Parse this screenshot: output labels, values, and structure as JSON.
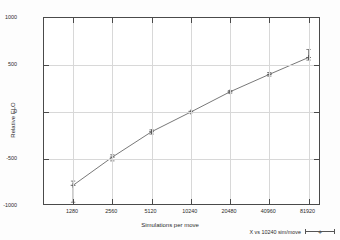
{
  "chart_data": {
    "type": "line",
    "title": "",
    "xlabel": "Simulations per move",
    "ylabel": "Relative ELO",
    "x_scale": "log2",
    "x_tick_labels": [
      "1280",
      "2560",
      "5120",
      "10240",
      "20480",
      "40960",
      "81920"
    ],
    "x": [
      1280,
      2560,
      5120,
      10240,
      20480,
      40960,
      81920
    ],
    "y_tick_labels": [
      "1000",
      "500",
      "0",
      "-500",
      "-1000"
    ],
    "ylim": [
      -1000,
      1000
    ],
    "grid": true,
    "legend_position": "bottom-right",
    "series": [
      {
        "name": "X vs 10240 sim/move",
        "values": [
          -780,
          -480,
          -210,
          0,
          215,
          400,
          580
        ],
        "error_low": [
          -960,
          -520,
          -235,
          -8,
          200,
          382,
          552
        ],
        "error_high": [
          -735,
          -455,
          -190,
          8,
          228,
          420,
          665
        ],
        "marker": "plus",
        "color": "#555555"
      }
    ]
  },
  "legend": {
    "entries": [
      {
        "label": "X vs 10240 sim/move"
      }
    ]
  },
  "colors": {
    "axis": "#4a4a4a",
    "grid": "#d8d8d8",
    "line": "#555555",
    "text": "#2b2b2b",
    "background": "#ffffff"
  }
}
